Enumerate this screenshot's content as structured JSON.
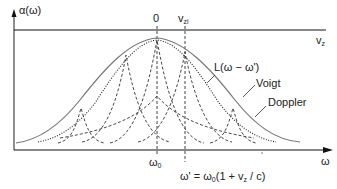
{
  "diagram": {
    "y_axis_label": "α(ω)",
    "x_axis_label": "ω",
    "top_axis_label": "v",
    "top_axis_label_sub": "z",
    "top_tick_zero": "0",
    "top_tick_vzi": "v",
    "top_tick_vzi_sub": "zi",
    "bottom_tick_omega0": "ω",
    "bottom_tick_omega0_sub": "0",
    "bottom_tick_omega_prime": "ω' = ω",
    "bottom_tick_omega_prime_sub": "0",
    "bottom_tick_omega_prime_rest": "(1 + v",
    "bottom_tick_omega_prime_sub2": "z",
    "bottom_tick_omega_prime_end": " / c)",
    "curve_labels": {
      "lorentz": "L(ω − ω')",
      "voigt": "Voigt",
      "doppler": "Doppler"
    },
    "colors": {
      "axis": "#1a1a1a",
      "voigt": "#666666",
      "doppler": "#222222",
      "lorentz": "#333333",
      "text": "#222222"
    }
  }
}
